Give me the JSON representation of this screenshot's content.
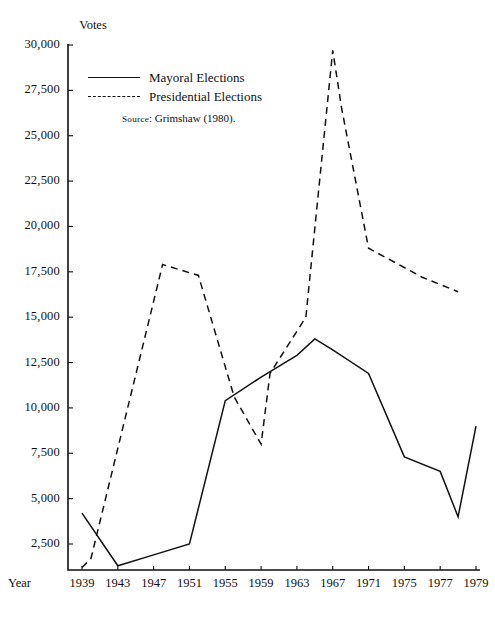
{
  "chart_data": {
    "type": "line",
    "title": "",
    "ylabel": "Votes",
    "xlabel": "Year",
    "ylim": [
      0,
      30000
    ],
    "y_ticks": [
      30000,
      27500,
      25000,
      22500,
      20000,
      17500,
      15000,
      12500,
      10000,
      7500,
      5000,
      2500
    ],
    "y_tick_labels": [
      "30,000",
      "27,500",
      "25,000",
      "22,500",
      "20,000",
      "17,500",
      "15,000",
      "12,500",
      "10,000",
      "7,500",
      "5,000",
      "2,500"
    ],
    "x_ticks": [
      1939,
      1943,
      1947,
      1951,
      1955,
      1959,
      1963,
      1967,
      1971,
      1975,
      1977,
      1979
    ],
    "x_tick_labels": [
      "1939",
      "1943",
      "1947",
      "1951",
      "1955",
      "1959",
      "1963",
      "1967",
      "1971",
      "1975",
      "1977",
      "1979"
    ],
    "xlim": [
      1939,
      1979
    ],
    "grid": false,
    "legend_position": "upper-left-inside",
    "series": [
      {
        "name": "Mayoral Elections",
        "style": "solid",
        "x": [
          1939,
          1943,
          1947,
          1951,
          1955,
          1959,
          1963,
          1965,
          1967,
          1971,
          1975,
          1977,
          1978,
          1979
        ],
        "values": [
          4200,
          1300,
          1900,
          2500,
          10400,
          11700,
          12900,
          13800,
          13200,
          11900,
          7300,
          6500,
          4000,
          9000
        ]
      },
      {
        "name": "Presidential Elections",
        "style": "dashed",
        "x": [
          1939,
          1940,
          1948,
          1952,
          1956,
          1959,
          1960,
          1964,
          1967,
          1968,
          1971,
          1976,
          1978
        ],
        "values": [
          1200,
          1700,
          17900,
          17300,
          10600,
          8000,
          11900,
          15000,
          29700,
          26500,
          18800,
          17200,
          16400
        ]
      }
    ],
    "annotations": [
      {
        "id": "source",
        "prefix": "Source",
        "text": ": Grimshaw (1980)."
      }
    ]
  },
  "legend": {
    "items": [
      {
        "label": "Mayoral Elections",
        "style": "solid"
      },
      {
        "label": "Presidential Elections",
        "style": "dashed"
      }
    ]
  },
  "axis_titles": {
    "y": "Votes",
    "x": "Year"
  },
  "source": {
    "prefix": "Source",
    "rest": ": Grimshaw (1980)."
  },
  "colors": {
    "ink": "#111111",
    "background": "#ffffff"
  }
}
